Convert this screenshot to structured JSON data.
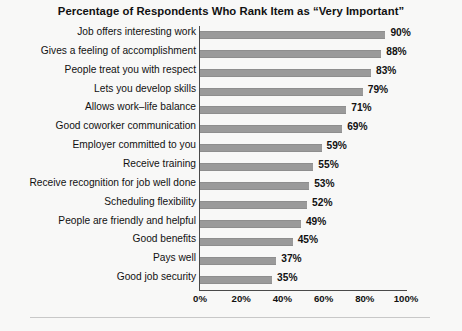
{
  "chart_data": {
    "type": "bar",
    "orientation": "horizontal",
    "title": "Percentage of Respondents Who Rank Item as “Very Important”",
    "xlabel": "",
    "ylabel": "",
    "xlim": [
      0,
      100
    ],
    "xticks": [
      "0%",
      "20%",
      "40%",
      "60%",
      "80%",
      "100%"
    ],
    "xtick_values": [
      0,
      20,
      40,
      60,
      80,
      100
    ],
    "grid": false,
    "legend": "none",
    "bar_color": "#9a9a9a",
    "categories": [
      "Job offers interesting work",
      "Gives a feeling of accomplishment",
      "People treat you with respect",
      "Lets you develop skills",
      "Allows work–life balance",
      "Good coworker communication",
      "Employer committed to you",
      "Receive training",
      "Receive recognition for job well done",
      "Scheduling flexibility",
      "People are friendly and helpful",
      "Good benefits",
      "Pays well",
      "Good job security"
    ],
    "values": [
      90,
      88,
      83,
      79,
      71,
      69,
      59,
      55,
      53,
      52,
      49,
      45,
      37,
      35
    ],
    "value_labels": [
      "90%",
      "88%",
      "83%",
      "79%",
      "71%",
      "69%",
      "59%",
      "55%",
      "53%",
      "52%",
      "49%",
      "45%",
      "37%",
      "35%"
    ]
  }
}
